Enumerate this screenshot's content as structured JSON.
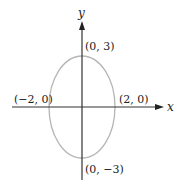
{
  "diagram": {
    "type": "ellipse-on-axes",
    "axes": {
      "x_label": "x",
      "y_label": "y"
    },
    "ellipse": {
      "center": [
        0,
        0
      ],
      "semi_axis_x": 2,
      "semi_axis_y": 3,
      "color": "#b5b5b5"
    },
    "points": [
      {
        "label": "(0, 3)"
      },
      {
        "label": "(0, −3)"
      },
      {
        "label": "(−2, 0)"
      },
      {
        "label": "(2, 0)"
      }
    ],
    "axis_color": "#333333"
  }
}
